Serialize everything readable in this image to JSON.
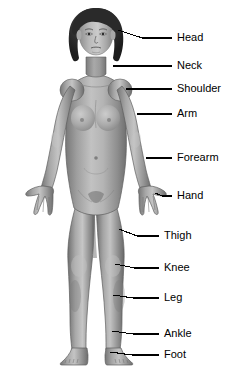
{
  "figure": {
    "background_color": "#ffffff",
    "line_color": "#000000",
    "text_color": "#000000",
    "palette": {
      "hair_dark": "#262626",
      "hair_mid": "#3d3d3d",
      "skin_base": "#9d9d9d",
      "skin_light": "#bcbcbc",
      "skin_highlight": "#d2d2d2",
      "skin_shadow": "#7b7b7b",
      "skin_deep_shadow": "#636363",
      "outline": "#4a4a4a"
    }
  },
  "labels": [
    {
      "id": "head",
      "text": "Head",
      "line_start_x": 118,
      "line_start_y": 30,
      "line_end_x": 172,
      "line_end_y": 38,
      "text_x": 177,
      "text_y": 38
    },
    {
      "id": "neck",
      "text": "Neck",
      "line_start_x": 113,
      "line_start_y": 66,
      "line_end_x": 172,
      "line_end_y": 66,
      "text_x": 177,
      "text_y": 66
    },
    {
      "id": "shoulder",
      "text": "Shoulder",
      "line_start_x": 126,
      "line_start_y": 89,
      "line_end_x": 172,
      "line_end_y": 89,
      "text_x": 177,
      "text_y": 89
    },
    {
      "id": "arm",
      "text": "Arm",
      "line_start_x": 137,
      "line_start_y": 114,
      "line_end_x": 172,
      "line_end_y": 114,
      "text_x": 177,
      "text_y": 114
    },
    {
      "id": "forearm",
      "text": "Forearm",
      "line_start_x": 146,
      "line_start_y": 158,
      "line_end_x": 172,
      "line_end_y": 158,
      "text_x": 177,
      "text_y": 158
    },
    {
      "id": "hand",
      "text": "Hand",
      "line_start_x": 155,
      "line_start_y": 193,
      "line_end_x": 172,
      "line_end_y": 196,
      "text_x": 177,
      "text_y": 196
    },
    {
      "id": "thigh",
      "text": "Thigh",
      "line_start_x": 119,
      "line_start_y": 229,
      "line_end_x": 159,
      "line_end_y": 236,
      "text_x": 164,
      "text_y": 236
    },
    {
      "id": "knee",
      "text": "Knee",
      "line_start_x": 115,
      "line_start_y": 264,
      "line_end_x": 159,
      "line_end_y": 268,
      "text_x": 164,
      "text_y": 268
    },
    {
      "id": "leg",
      "text": "Leg",
      "line_start_x": 113,
      "line_start_y": 295,
      "line_end_x": 159,
      "line_end_y": 298,
      "text_x": 164,
      "text_y": 298
    },
    {
      "id": "ankle",
      "text": "Ankle",
      "line_start_x": 112,
      "line_start_y": 331,
      "line_end_x": 159,
      "line_end_y": 334,
      "text_x": 164,
      "text_y": 334
    },
    {
      "id": "foot",
      "text": "Foot",
      "line_start_x": 110,
      "line_start_y": 352,
      "line_end_x": 159,
      "line_end_y": 355,
      "text_x": 164,
      "text_y": 355
    }
  ]
}
